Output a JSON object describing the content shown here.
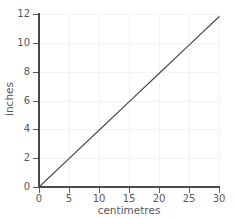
{
  "chart_data": {
    "type": "line",
    "title": "",
    "xlabel": "centimetres",
    "ylabel": "inches",
    "xlim": [
      0,
      30
    ],
    "ylim": [
      0,
      12
    ],
    "xticks": [
      0,
      5,
      10,
      15,
      20,
      25,
      30
    ],
    "yticks": [
      0,
      2,
      4,
      6,
      8,
      10,
      12
    ],
    "xtick_labels": [
      "0",
      "5",
      "10",
      "15",
      "20",
      "25",
      "30"
    ],
    "ytick_labels": [
      "0",
      "2",
      "4",
      "6",
      "8",
      "10",
      "12"
    ],
    "grid": true,
    "legend": null,
    "series": [
      {
        "name": "centimetres to inches",
        "color": "#4a4a4a",
        "x": [
          0,
          5,
          10,
          15,
          20,
          25,
          30
        ],
        "values": [
          0,
          1.9685,
          3.937,
          5.9055,
          7.874,
          9.8425,
          11.811
        ]
      }
    ]
  },
  "axes": {
    "x_axis_name": "centimetres",
    "y_axis_name": "inches"
  },
  "colors": {
    "line": "#4a4a4a",
    "spine": "#4a4a4a",
    "grid": "#f2f2f4",
    "text": "#58585a",
    "background": "#ffffff"
  }
}
